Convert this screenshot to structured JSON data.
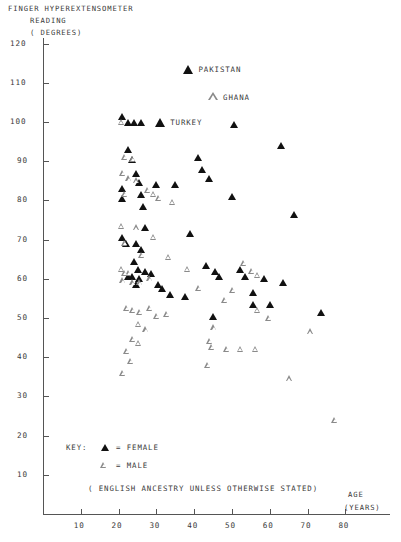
{
  "chart_data": {
    "type": "scatter",
    "title": "FINGER HYPEREXTENSOMETER",
    "title_line2": "READING",
    "title_line3": "( DEGREES)",
    "xlabel": "AGE",
    "xlabel_line2": "(YEARS)",
    "ylabel": "FINGER HYPEREXTENSOMETER READING ( DEGREES)",
    "xlim": [
      0,
      85
    ],
    "ylim": [
      0,
      125
    ],
    "xticks": [
      10,
      20,
      30,
      40,
      50,
      60,
      70,
      80
    ],
    "yticks": [
      10,
      20,
      30,
      40,
      50,
      60,
      70,
      80,
      90,
      100,
      110,
      120
    ],
    "grid": false,
    "legend_position": "inside-bottom-left",
    "legend_title": "KEY:",
    "legend": [
      {
        "marker": "filled-triangle",
        "label": "= FEMALE",
        "series": "FEMALE"
      },
      {
        "marker": "open-triangle",
        "label": "= MALE",
        "series": "MALE"
      }
    ],
    "footnote": "( ENGLISH ANCESTRY UNLESS OTHERWISE STATED)",
    "annotations": [
      {
        "text": "PAKISTAN",
        "x": 38.5,
        "y": 113.5,
        "series": "FEMALE",
        "marker": "filled-triangle"
      },
      {
        "text": "GHANA",
        "x": 45.0,
        "y": 106.5,
        "series": "MALE",
        "marker": "open-triangle"
      },
      {
        "text": "TURKEY",
        "x": 31.0,
        "y": 100.0,
        "series": "FEMALE",
        "marker": "filled-triangle"
      }
    ],
    "series": [
      {
        "name": "FEMALE",
        "marker": "filled-triangle",
        "color": "#111111",
        "points": [
          [
            38.5,
            113.5
          ],
          [
            31.0,
            100.0
          ],
          [
            21.0,
            101.5
          ],
          [
            22.5,
            100.0
          ],
          [
            24.0,
            100.0
          ],
          [
            26.0,
            100.0
          ],
          [
            50.5,
            99.5
          ],
          [
            22.5,
            93.0
          ],
          [
            23.5,
            90.5
          ],
          [
            41.0,
            91.0
          ],
          [
            24.5,
            87.0
          ],
          [
            42.0,
            88.0
          ],
          [
            25.5,
            84.5
          ],
          [
            21.0,
            83.0
          ],
          [
            21.0,
            80.5
          ],
          [
            30.0,
            84.0
          ],
          [
            35.0,
            84.0
          ],
          [
            44.0,
            85.5
          ],
          [
            26.0,
            81.5
          ],
          [
            50.0,
            81.0
          ],
          [
            26.5,
            78.5
          ],
          [
            66.5,
            76.5
          ],
          [
            27.0,
            73.0
          ],
          [
            39.0,
            71.5
          ],
          [
            21.0,
            70.5
          ],
          [
            22.0,
            69.0
          ],
          [
            24.5,
            69.0
          ],
          [
            26.0,
            67.5
          ],
          [
            24.0,
            64.5
          ],
          [
            25.0,
            62.5
          ],
          [
            27.0,
            62.0
          ],
          [
            28.5,
            61.5
          ],
          [
            23.5,
            60.5
          ],
          [
            25.5,
            60.0
          ],
          [
            22.5,
            60.5
          ],
          [
            43.0,
            63.5
          ],
          [
            45.5,
            62.0
          ],
          [
            46.5,
            60.5
          ],
          [
            52.0,
            62.5
          ],
          [
            53.5,
            60.5
          ],
          [
            58.5,
            60.0
          ],
          [
            24.5,
            58.5
          ],
          [
            30.5,
            58.5
          ],
          [
            31.5,
            57.5
          ],
          [
            33.5,
            56.0
          ],
          [
            55.5,
            56.5
          ],
          [
            37.5,
            55.5
          ],
          [
            63.5,
            59.0
          ],
          [
            60.0,
            53.5
          ],
          [
            73.5,
            51.5
          ],
          [
            45.0,
            50.5
          ],
          [
            55.5,
            53.5
          ],
          [
            63.0,
            94.0
          ]
        ]
      },
      {
        "name": "MALE",
        "marker": "open-triangle",
        "color": "#8a8a8a",
        "points": [
          [
            45.0,
            106.5
          ],
          [
            21.0,
            100.0
          ],
          [
            22.0,
            91.0
          ],
          [
            24.0,
            90.5
          ],
          [
            21.5,
            87.0
          ],
          [
            23.0,
            85.5
          ],
          [
            25.0,
            85.0
          ],
          [
            22.0,
            81.5
          ],
          [
            28.0,
            82.5
          ],
          [
            29.5,
            81.5
          ],
          [
            31.0,
            80.5
          ],
          [
            34.5,
            79.5
          ],
          [
            21.0,
            73.5
          ],
          [
            25.0,
            73.0
          ],
          [
            29.5,
            70.5
          ],
          [
            22.0,
            69.0
          ],
          [
            26.5,
            66.0
          ],
          [
            33.5,
            65.5
          ],
          [
            21.0,
            62.5
          ],
          [
            22.0,
            61.5
          ],
          [
            23.0,
            61.5
          ],
          [
            21.5,
            59.5
          ],
          [
            24.0,
            59.0
          ],
          [
            26.0,
            59.0
          ],
          [
            28.5,
            60.0
          ],
          [
            38.5,
            62.5
          ],
          [
            53.5,
            64.0
          ],
          [
            55.5,
            62.0
          ],
          [
            57.0,
            61.0
          ],
          [
            41.5,
            57.5
          ],
          [
            50.5,
            57.0
          ],
          [
            22.5,
            52.5
          ],
          [
            24.0,
            52.0
          ],
          [
            26.0,
            51.5
          ],
          [
            28.5,
            52.5
          ],
          [
            30.5,
            50.5
          ],
          [
            33.0,
            51.0
          ],
          [
            25.5,
            48.5
          ],
          [
            27.5,
            47.0
          ],
          [
            45.5,
            47.5
          ],
          [
            57.0,
            52.0
          ],
          [
            60.0,
            50.0
          ],
          [
            24.0,
            44.5
          ],
          [
            25.5,
            43.5
          ],
          [
            44.5,
            44.0
          ],
          [
            45.0,
            42.5
          ],
          [
            49.0,
            42.0
          ],
          [
            52.5,
            42.0
          ],
          [
            56.5,
            42.0
          ],
          [
            22.5,
            41.5
          ],
          [
            23.5,
            39.0
          ],
          [
            44.0,
            38.0
          ],
          [
            21.5,
            36.0
          ],
          [
            65.5,
            34.5
          ],
          [
            77.5,
            24.0
          ],
          [
            71.0,
            46.5
          ],
          [
            48.5,
            54.5
          ]
        ]
      }
    ]
  },
  "axes": {
    "x_axis_name": "age-axis",
    "y_axis_name": "reading-axis"
  }
}
